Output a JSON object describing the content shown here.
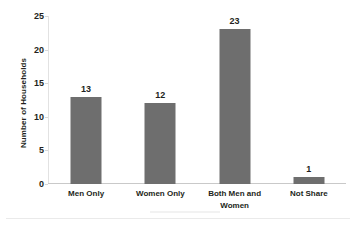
{
  "chart_data": {
    "type": "bar",
    "title": "",
    "subtitle": "",
    "xlabel": "",
    "ylabel": "Number of Households",
    "categories": [
      "Men Only",
      "Women Only",
      "Both Men and Women",
      "Not Share"
    ],
    "category_lines": [
      [
        "Men Only"
      ],
      [
        "Women Only"
      ],
      [
        "Both Men and",
        "Women"
      ],
      [
        "Not Share"
      ]
    ],
    "values": [
      13,
      12,
      23,
      1
    ],
    "value_labels": [
      "13",
      "12",
      "23",
      "1"
    ],
    "ylim": [
      0,
      25
    ],
    "yticks": [
      0,
      5,
      10,
      15,
      20,
      25
    ],
    "ytick_labels": [
      "0",
      "5",
      "10",
      "15",
      "20",
      "25"
    ],
    "grid": false,
    "legend": false,
    "legend_position": "none",
    "bar_color": "#6e6e6e",
    "text_color": "#231f20",
    "axis_color": "#c9c9c9",
    "background": "#ffffff"
  },
  "icons": {
    "bar_glyph": "bar-rect"
  }
}
